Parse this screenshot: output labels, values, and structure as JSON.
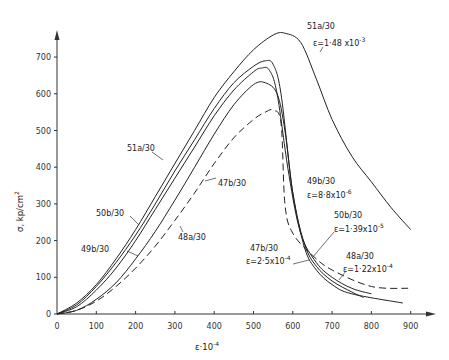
{
  "chart_data": {
    "type": "line",
    "title": "",
    "xlabel": "ε·10⁻⁴",
    "ylabel": "σ, kp/cm²",
    "xlim": [
      0,
      950
    ],
    "ylim": [
      0,
      760
    ],
    "x_ticks": [
      0,
      100,
      200,
      300,
      400,
      500,
      600,
      700,
      800,
      900
    ],
    "y_ticks": [
      0,
      100,
      200,
      300,
      400,
      500,
      600,
      700
    ],
    "grid": false,
    "legend": "inline labels",
    "series": [
      {
        "name": "51a/30",
        "annotation": "ε=1·48 x10⁻³",
        "style": "solid",
        "x": [
          0,
          50,
          100,
          150,
          200,
          250,
          300,
          350,
          400,
          450,
          500,
          550,
          580,
          620,
          660,
          700,
          750,
          800,
          850,
          900
        ],
        "y": [
          0,
          30,
          80,
          150,
          230,
          320,
          410,
          500,
          590,
          660,
          720,
          760,
          765,
          740,
          640,
          530,
          430,
          360,
          290,
          230
        ]
      },
      {
        "name": "50b/30",
        "annotation": "ε=1·39 x10⁻⁵",
        "style": "solid",
        "x": [
          0,
          50,
          100,
          150,
          200,
          250,
          300,
          350,
          400,
          450,
          500,
          530,
          550,
          570,
          600,
          630,
          660,
          700,
          750,
          780
        ],
        "y": [
          0,
          25,
          75,
          140,
          215,
          300,
          390,
          475,
          560,
          630,
          675,
          690,
          680,
          600,
          330,
          190,
          130,
          90,
          60,
          45
        ]
      },
      {
        "name": "49b/30",
        "annotation": "ε=8·8 x10⁻⁶",
        "style": "solid",
        "x": [
          0,
          50,
          100,
          150,
          200,
          250,
          300,
          350,
          400,
          450,
          500,
          520,
          540,
          560,
          590,
          620,
          660,
          700,
          750,
          800
        ],
        "y": [
          0,
          20,
          65,
          125,
          200,
          285,
          370,
          455,
          540,
          610,
          660,
          670,
          665,
          600,
          380,
          220,
          140,
          100,
          70,
          55
        ]
      },
      {
        "name": "47b/30",
        "annotation": "ε=2·5 x10⁻⁴",
        "style": "solid",
        "x": [
          0,
          50,
          100,
          150,
          200,
          250,
          300,
          350,
          400,
          450,
          500,
          530,
          560,
          580,
          600,
          630,
          660,
          700,
          750,
          880
        ],
        "y": [
          0,
          10,
          40,
          85,
          150,
          225,
          310,
          400,
          490,
          570,
          625,
          630,
          600,
          500,
          330,
          180,
          120,
          80,
          55,
          30
        ]
      },
      {
        "name": "48a/30",
        "annotation": "ε=1·22 x10⁻⁴",
        "style": "dashed",
        "x": [
          0,
          50,
          100,
          150,
          200,
          250,
          300,
          350,
          400,
          450,
          500,
          530,
          550,
          570,
          580,
          600,
          650,
          700,
          800,
          900
        ],
        "y": [
          0,
          10,
          35,
          75,
          125,
          185,
          255,
          330,
          410,
          480,
          530,
          550,
          555,
          520,
          300,
          220,
          160,
          120,
          75,
          70
        ]
      }
    ]
  },
  "labels": {
    "x_axis_title": "ε·10",
    "x_axis_exp": "-4",
    "y_axis_title": "σ, kp/cm",
    "y_axis_exp": "2",
    "s51a_name": "51a/30",
    "s51a_ann": "ε=1·48 x10",
    "s51a_exp": "-3",
    "s51a_left": "51a/30",
    "s50b_left": "50b/30",
    "s49b_left": "49b/30",
    "s47b_mid": "47b/30",
    "s48a_mid": "48a/30",
    "s49b_right": "49b/30",
    "s49b_ann": "ε=8·8x10",
    "s49b_exp": "-6",
    "s50b_right": "50b/30",
    "s50b_ann": "ε=1·39x10",
    "s50b_exp": "-5",
    "s47b_right": "47b/30",
    "s47b_ann": "ε=2·5x10",
    "s47b_exp": "-4",
    "s48a_right": "48a/30",
    "s48a_ann": "ε=1·22x10",
    "s48a_exp": "-4"
  }
}
